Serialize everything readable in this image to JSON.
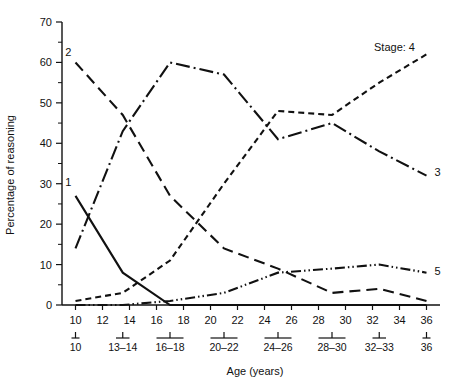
{
  "chart_data": {
    "type": "line",
    "title": "",
    "xlabel": "Age (years)",
    "ylabel": "Percentage of reasoning",
    "xlim": [
      9,
      37
    ],
    "ylim": [
      0,
      70
    ],
    "grid": false,
    "legend_position": "inline-end-labels",
    "legend_prefix": "Stage:",
    "x_tick_labels": [
      "10",
      "12",
      "14",
      "16",
      "18",
      "20",
      "22",
      "24",
      "26",
      "28",
      "30",
      "32",
      "34",
      "36"
    ],
    "x_tick_values": [
      10,
      12,
      14,
      16,
      18,
      20,
      22,
      24,
      26,
      28,
      30,
      32,
      34,
      36
    ],
    "x_group_labels": [
      "10",
      "13–14",
      "16–18",
      "20–22",
      "24–26",
      "28–30",
      "32–33",
      "36"
    ],
    "x_group_centers": [
      10,
      13.5,
      17,
      21,
      25,
      29,
      32.5,
      36
    ],
    "x_group_spans": [
      [
        10,
        10
      ],
      [
        13,
        14
      ],
      [
        16,
        18
      ],
      [
        20,
        22
      ],
      [
        24,
        26
      ],
      [
        28,
        30
      ],
      [
        32,
        33
      ],
      [
        36,
        36
      ]
    ],
    "y_tick_labels": [
      "0",
      "10",
      "20",
      "30",
      "40",
      "50",
      "60",
      "70"
    ],
    "y_tick_values": [
      0,
      10,
      20,
      30,
      40,
      50,
      60,
      70
    ],
    "y_minor_values": [
      5,
      15,
      25,
      35,
      45,
      55,
      65
    ],
    "series": [
      {
        "name": "1",
        "label": "1",
        "style": "solid",
        "x": [
          10,
          13.5,
          17,
          21,
          25,
          29,
          32.5,
          36
        ],
        "values": [
          27,
          8,
          0,
          0,
          0,
          0,
          0,
          0
        ]
      },
      {
        "name": "2",
        "label": "2",
        "style": "long-dash",
        "x": [
          10,
          13.5,
          17,
          21,
          25,
          29,
          32.5,
          36
        ],
        "values": [
          60,
          47,
          27,
          14,
          9,
          3,
          4,
          1
        ]
      },
      {
        "name": "3",
        "label": "3",
        "style": "dash-dot",
        "x": [
          10,
          13.5,
          17,
          21,
          25,
          29,
          32.5,
          36
        ],
        "values": [
          14,
          43,
          60,
          57,
          41,
          45,
          38,
          32
        ]
      },
      {
        "name": "4",
        "label": "4",
        "style": "short-dash",
        "x": [
          10,
          13.5,
          17,
          21,
          25,
          29,
          32.5,
          36
        ],
        "values": [
          1,
          3,
          11,
          30,
          48,
          47,
          55,
          62
        ]
      },
      {
        "name": "5",
        "label": "5",
        "style": "dash-dot-dot",
        "x": [
          10,
          13.5,
          17,
          21,
          25,
          29,
          32.5,
          36
        ],
        "values": [
          0,
          0,
          1,
          3,
          8,
          9,
          10,
          8
        ]
      }
    ],
    "series_start_labels": [
      {
        "name": "2",
        "text": "2",
        "x": 9.7,
        "y": 61.5
      },
      {
        "name": "1",
        "text": "1",
        "x": 9.7,
        "y": 29.5
      }
    ],
    "series_end_labels": [
      {
        "name": "3",
        "text": "3",
        "x": 36.6,
        "y": 33
      },
      {
        "name": "5",
        "text": "5",
        "x": 36.6,
        "y": 8.5
      }
    ]
  }
}
